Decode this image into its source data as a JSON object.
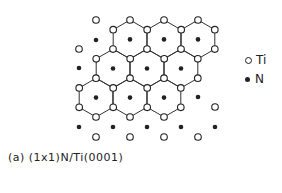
{
  "caption": "(a) (1x1)N/Ti(0001)",
  "legend": [
    {
      "symbol": "open-circle",
      "label": "Ti"
    },
    {
      "symbol": "filled-dot",
      "label": "N"
    }
  ],
  "colors": {
    "line": "#333333",
    "atom": "#222222",
    "background": "#ffffff"
  },
  "lattice": {
    "hex_radius": 19.4,
    "hexagon_centers": [
      [
        130,
        39.4
      ],
      [
        164,
        39.4
      ],
      [
        198,
        39.4
      ],
      [
        113,
        68.5
      ],
      [
        147,
        68.5
      ],
      [
        181,
        68.5
      ],
      [
        96,
        97.6
      ],
      [
        130,
        97.6
      ],
      [
        164,
        97.6
      ]
    ],
    "extra_ti": [
      [
        96,
        20
      ],
      [
        79,
        49
      ],
      [
        215,
        107
      ],
      [
        96,
        137
      ],
      [
        130,
        137
      ],
      [
        164,
        137
      ],
      [
        198,
        137
      ]
    ],
    "extra_n": [
      [
        96,
        40
      ],
      [
        79,
        68
      ],
      [
        198,
        97
      ],
      [
        79,
        127
      ],
      [
        113,
        127
      ],
      [
        147,
        127
      ],
      [
        181,
        127
      ],
      [
        215,
        127
      ]
    ]
  }
}
